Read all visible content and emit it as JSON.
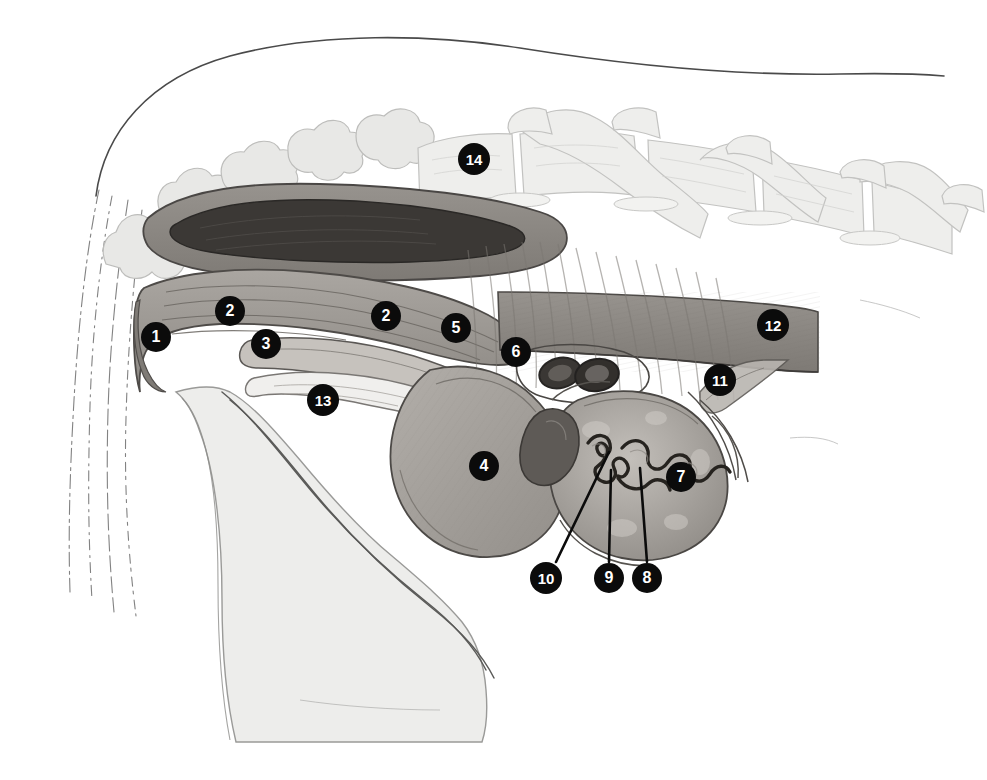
{
  "figure": {
    "background_color": "#ffffff",
    "width": 987,
    "height": 780,
    "marker_fill": "#0b0b0b",
    "marker_text_color": "#ffffff"
  },
  "markers": [
    {
      "id": "marker-1",
      "label": "1",
      "x": 156,
      "y": 337,
      "size": "m1"
    },
    {
      "id": "marker-2a",
      "label": "2",
      "x": 230,
      "y": 311,
      "size": "m1"
    },
    {
      "id": "marker-3",
      "label": "3",
      "x": 266,
      "y": 344,
      "size": "m1"
    },
    {
      "id": "marker-2b",
      "label": "2",
      "x": 386,
      "y": 316,
      "size": "m1"
    },
    {
      "id": "marker-5",
      "label": "5",
      "x": 456,
      "y": 328,
      "size": "m1"
    },
    {
      "id": "marker-6",
      "label": "6",
      "x": 516,
      "y": 352,
      "size": "m1"
    },
    {
      "id": "marker-13",
      "label": "13",
      "x": 323,
      "y": 400,
      "size": "m2"
    },
    {
      "id": "marker-4",
      "label": "4",
      "x": 484,
      "y": 466,
      "size": "m1"
    },
    {
      "id": "marker-7",
      "label": "7",
      "x": 681,
      "y": 477,
      "size": "m1"
    },
    {
      "id": "marker-11",
      "label": "11",
      "x": 720,
      "y": 380,
      "size": "m2"
    },
    {
      "id": "marker-12",
      "label": "12",
      "x": 773,
      "y": 325,
      "size": "m2"
    },
    {
      "id": "marker-14",
      "label": "14",
      "x": 474,
      "y": 159,
      "size": "m2"
    },
    {
      "id": "marker-10",
      "label": "10",
      "x": 546,
      "y": 578,
      "size": "m2"
    },
    {
      "id": "marker-9",
      "label": "9",
      "x": 609,
      "y": 578,
      "size": "m1"
    },
    {
      "id": "marker-8",
      "label": "8",
      "x": 647,
      "y": 578,
      "size": "m1"
    }
  ],
  "leader_lines": [
    {
      "id": "leader-10",
      "from_x": 556,
      "from_y": 562,
      "to_x": 609,
      "to_y": 452
    },
    {
      "id": "leader-9",
      "from_x": 609,
      "from_y": 562,
      "to_x": 611,
      "to_y": 470
    },
    {
      "id": "leader-8",
      "from_x": 647,
      "from_y": 562,
      "to_x": 640,
      "to_y": 468
    }
  ],
  "palette": {
    "outline_dark": "#3a3a3a",
    "outline_mid": "#6e6e6e",
    "outline_faint": "#b9b9b9",
    "bone_pale": "#e9e9e7",
    "bone_pale_2": "#efefee",
    "tissue_mid": "#9b9792",
    "tissue_mid_2": "#a8a49f",
    "tissue_dark": "#6b6661",
    "lumen_dark": "#3d3a37",
    "organ_fill": "#9e9a95",
    "organ_fill_light": "#bfbbb6",
    "muscle_band": "#8e8a85"
  }
}
